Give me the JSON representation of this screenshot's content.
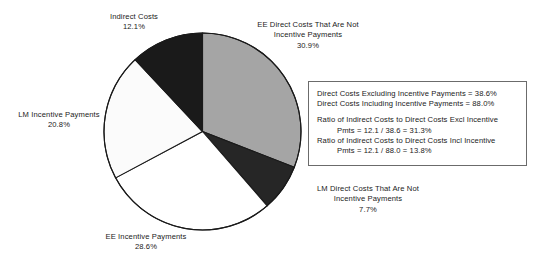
{
  "chart_data": {
    "type": "pie",
    "title": "",
    "subtitle": "",
    "xlabel": "",
    "ylabel": "",
    "legend_position": "none",
    "grid": false,
    "units": "percent",
    "start_angle_deg": 0,
    "direction": "clockwise",
    "categories": [
      "EE Direct Costs That Are Not Incentive Payments",
      "LM Direct Costs That Are Not Incentive Payments",
      "EE Incentive Payments",
      "LM Incentive Payments",
      "Indirect Costs"
    ],
    "values": [
      30.9,
      7.7,
      28.6,
      20.8,
      12.1
    ],
    "colors": [
      "#a5a5a5",
      "#262626",
      "#ffffff",
      "#fbfbfb",
      "#1a1a1a"
    ],
    "slices": [
      {
        "id": "ee-direct",
        "label_lines": [
          "EE Direct Costs That Are Not",
          "Incentive Payments"
        ],
        "value_text": "30.9%",
        "value": 30.9,
        "color": "#a5a5a5",
        "start_deg": 0.0,
        "end_deg": 111.24
      },
      {
        "id": "lm-direct",
        "label_lines": [
          "LM Direct Costs That Are Not",
          "Incentive Payments"
        ],
        "value_text": "7.7%",
        "value": 7.7,
        "color": "#262626",
        "start_deg": 111.24,
        "end_deg": 138.96
      },
      {
        "id": "ee-incentive",
        "label_lines": [
          "EE Incentive Payments"
        ],
        "value_text": "28.6%",
        "value": 28.6,
        "color": "#ffffff",
        "start_deg": 138.96,
        "end_deg": 241.92
      },
      {
        "id": "lm-incentive",
        "label_lines": [
          "LM Incentive Payments"
        ],
        "value_text": "20.8%",
        "value": 20.8,
        "color": "#fbfbfb",
        "start_deg": 241.92,
        "end_deg": 316.8
      },
      {
        "id": "indirect",
        "label_lines": [
          "Indirect Costs"
        ],
        "value_text": "12.1%",
        "value": 12.1,
        "color": "#1a1a1a",
        "start_deg": 316.8,
        "end_deg": 360.0
      }
    ]
  },
  "labels": {
    "indirect": {
      "line1": "Indirect Costs",
      "value": "12.1%"
    },
    "ee_direct": {
      "line1": "EE Direct Costs That Are Not",
      "line2": "Incentive Payments",
      "value": "30.9%"
    },
    "lm_incentive": {
      "line1": "LM Incentive Payments",
      "value": "20.8%"
    },
    "ee_incentive": {
      "line1": "EE Incentive Payments",
      "value": "28.6%"
    },
    "lm_direct": {
      "line1": "LM Direct Costs That Are Not",
      "line2": "Incentive Payments",
      "value": "7.7%"
    }
  },
  "annotation": {
    "line1": "Direct Costs Excluding Incentive Payments = 38.6%",
    "line2": "Direct Costs Including Incentive Payments = 88.0%",
    "line3": "Ratio of Indirect Costs to Direct Costs Excl Incentive",
    "line4": "Pmts = 12.1 / 38.6 = 31.3%",
    "line5": "Ratio of Indirect Costs to Direct Costs Incl Incentive",
    "line6": "Pmts = 12.1 / 88.0 = 13.8%"
  },
  "style": {
    "outline_color": "#1a1a1a",
    "box_border_color": "#6b6b6b",
    "background": "#ffffff"
  }
}
